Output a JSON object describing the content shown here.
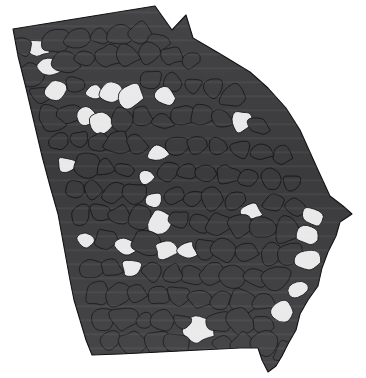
{
  "figure": {
    "type": "choropleth-map",
    "region_name": "Georgia",
    "subdivision_type": "county",
    "subdivision_count": 159,
    "background_color": "#ffffff",
    "border_color": "#15151a",
    "title": "",
    "subtitle": "",
    "legend_visible": false,
    "labels_visible": false,
    "axis_visible": false
  },
  "chart_data": {
    "type": "heatmap",
    "title": "",
    "xlabel": "",
    "ylabel": "",
    "legend_position": "none",
    "grid": false,
    "classes": [
      {
        "key": "dark",
        "color": "#3b3b3d",
        "count": 134
      },
      {
        "key": "light",
        "color": "#e9e9e9",
        "count": 25
      }
    ],
    "categories": [
      "dark",
      "light"
    ],
    "values": [
      134,
      25
    ],
    "regions": [
      {
        "name": "county-001",
        "class": "light",
        "cx": 36,
        "cy": 48
      },
      {
        "name": "county-002",
        "class": "dark",
        "cx": 22,
        "cy": 46
      },
      {
        "name": "county-003",
        "class": "dark",
        "cx": 56,
        "cy": 40
      },
      {
        "name": "county-004",
        "class": "dark",
        "cx": 78,
        "cy": 38
      },
      {
        "name": "county-005",
        "class": "dark",
        "cx": 99,
        "cy": 36
      },
      {
        "name": "county-006",
        "class": "dark",
        "cx": 120,
        "cy": 34
      },
      {
        "name": "county-007",
        "class": "dark",
        "cx": 141,
        "cy": 33
      },
      {
        "name": "county-008",
        "class": "dark",
        "cx": 160,
        "cy": 42
      },
      {
        "name": "county-009",
        "class": "dark",
        "cx": 30,
        "cy": 74
      },
      {
        "name": "county-010",
        "class": "light",
        "cx": 47,
        "cy": 66
      },
      {
        "name": "county-011",
        "class": "dark",
        "cx": 66,
        "cy": 62
      },
      {
        "name": "county-012",
        "class": "dark",
        "cx": 86,
        "cy": 58
      },
      {
        "name": "county-013",
        "class": "dark",
        "cx": 106,
        "cy": 56
      },
      {
        "name": "county-014",
        "class": "dark",
        "cx": 127,
        "cy": 54
      },
      {
        "name": "county-015",
        "class": "dark",
        "cx": 148,
        "cy": 52
      },
      {
        "name": "county-016",
        "class": "dark",
        "cx": 170,
        "cy": 56
      },
      {
        "name": "county-017",
        "class": "dark",
        "cx": 190,
        "cy": 60
      },
      {
        "name": "county-018",
        "class": "dark",
        "cx": 40,
        "cy": 94
      },
      {
        "name": "county-019",
        "class": "light",
        "cx": 56,
        "cy": 88
      },
      {
        "name": "county-020",
        "class": "dark",
        "cx": 74,
        "cy": 84
      },
      {
        "name": "county-021",
        "class": "light",
        "cx": 94,
        "cy": 92
      },
      {
        "name": "county-022",
        "class": "light",
        "cx": 112,
        "cy": 92
      },
      {
        "name": "county-023",
        "class": "light",
        "cx": 130,
        "cy": 96
      },
      {
        "name": "county-024",
        "class": "dark",
        "cx": 150,
        "cy": 80
      },
      {
        "name": "county-025",
        "class": "dark",
        "cx": 172,
        "cy": 82
      },
      {
        "name": "county-026",
        "class": "light",
        "cx": 164,
        "cy": 96
      },
      {
        "name": "county-027",
        "class": "dark",
        "cx": 193,
        "cy": 86
      },
      {
        "name": "county-028",
        "class": "dark",
        "cx": 212,
        "cy": 88
      },
      {
        "name": "county-029",
        "class": "dark",
        "cx": 232,
        "cy": 96
      },
      {
        "name": "county-030",
        "class": "dark",
        "cx": 50,
        "cy": 118
      },
      {
        "name": "county-031",
        "class": "dark",
        "cx": 68,
        "cy": 114
      },
      {
        "name": "county-032",
        "class": "light",
        "cx": 86,
        "cy": 116
      },
      {
        "name": "county-033",
        "class": "light",
        "cx": 102,
        "cy": 122
      },
      {
        "name": "county-034",
        "class": "dark",
        "cx": 122,
        "cy": 120
      },
      {
        "name": "county-035",
        "class": "dark",
        "cx": 142,
        "cy": 118
      },
      {
        "name": "county-036",
        "class": "dark",
        "cx": 162,
        "cy": 120
      },
      {
        "name": "county-037",
        "class": "dark",
        "cx": 182,
        "cy": 116
      },
      {
        "name": "county-038",
        "class": "dark",
        "cx": 202,
        "cy": 116
      },
      {
        "name": "county-039",
        "class": "dark",
        "cx": 222,
        "cy": 120
      },
      {
        "name": "county-040",
        "class": "light",
        "cx": 240,
        "cy": 122
      },
      {
        "name": "county-041",
        "class": "dark",
        "cx": 258,
        "cy": 126
      },
      {
        "name": "county-042",
        "class": "dark",
        "cx": 58,
        "cy": 142
      },
      {
        "name": "county-043",
        "class": "dark",
        "cx": 78,
        "cy": 140
      },
      {
        "name": "county-044",
        "class": "dark",
        "cx": 98,
        "cy": 142
      },
      {
        "name": "county-045",
        "class": "dark",
        "cx": 118,
        "cy": 144
      },
      {
        "name": "county-046",
        "class": "dark",
        "cx": 138,
        "cy": 146
      },
      {
        "name": "county-047",
        "class": "light",
        "cx": 158,
        "cy": 152
      },
      {
        "name": "county-048",
        "class": "dark",
        "cx": 178,
        "cy": 146
      },
      {
        "name": "county-049",
        "class": "dark",
        "cx": 198,
        "cy": 146
      },
      {
        "name": "county-050",
        "class": "dark",
        "cx": 218,
        "cy": 148
      },
      {
        "name": "county-051",
        "class": "dark",
        "cx": 240,
        "cy": 150
      },
      {
        "name": "county-052",
        "class": "dark",
        "cx": 262,
        "cy": 152
      },
      {
        "name": "county-053",
        "class": "dark",
        "cx": 282,
        "cy": 156
      },
      {
        "name": "county-054",
        "class": "light",
        "cx": 66,
        "cy": 166
      },
      {
        "name": "county-055",
        "class": "dark",
        "cx": 86,
        "cy": 166
      },
      {
        "name": "county-056",
        "class": "dark",
        "cx": 106,
        "cy": 168
      },
      {
        "name": "county-057",
        "class": "dark",
        "cx": 126,
        "cy": 170
      },
      {
        "name": "county-058",
        "class": "light",
        "cx": 146,
        "cy": 176
      },
      {
        "name": "county-059",
        "class": "dark",
        "cx": 168,
        "cy": 172
      },
      {
        "name": "county-060",
        "class": "dark",
        "cx": 188,
        "cy": 172
      },
      {
        "name": "county-061",
        "class": "dark",
        "cx": 208,
        "cy": 174
      },
      {
        "name": "county-062",
        "class": "dark",
        "cx": 228,
        "cy": 176
      },
      {
        "name": "county-063",
        "class": "dark",
        "cx": 250,
        "cy": 178
      },
      {
        "name": "county-064",
        "class": "dark",
        "cx": 272,
        "cy": 180
      },
      {
        "name": "county-065",
        "class": "dark",
        "cx": 292,
        "cy": 184
      },
      {
        "name": "county-066",
        "class": "dark",
        "cx": 74,
        "cy": 190
      },
      {
        "name": "county-067",
        "class": "dark",
        "cx": 94,
        "cy": 190
      },
      {
        "name": "county-068",
        "class": "dark",
        "cx": 114,
        "cy": 192
      },
      {
        "name": "county-069",
        "class": "light",
        "cx": 152,
        "cy": 200
      },
      {
        "name": "county-070",
        "class": "dark",
        "cx": 134,
        "cy": 194
      },
      {
        "name": "county-071",
        "class": "dark",
        "cx": 174,
        "cy": 196
      },
      {
        "name": "county-072",
        "class": "dark",
        "cx": 194,
        "cy": 198
      },
      {
        "name": "county-073",
        "class": "dark",
        "cx": 214,
        "cy": 200
      },
      {
        "name": "county-074",
        "class": "dark",
        "cx": 236,
        "cy": 200
      },
      {
        "name": "county-075",
        "class": "light",
        "cx": 252,
        "cy": 212
      },
      {
        "name": "county-076",
        "class": "dark",
        "cx": 274,
        "cy": 204
      },
      {
        "name": "county-077",
        "class": "dark",
        "cx": 296,
        "cy": 208
      },
      {
        "name": "county-078",
        "class": "light",
        "cx": 314,
        "cy": 216
      },
      {
        "name": "county-079",
        "class": "dark",
        "cx": 80,
        "cy": 214
      },
      {
        "name": "county-080",
        "class": "dark",
        "cx": 100,
        "cy": 214
      },
      {
        "name": "county-081",
        "class": "dark",
        "cx": 120,
        "cy": 216
      },
      {
        "name": "county-082",
        "class": "dark",
        "cx": 140,
        "cy": 218
      },
      {
        "name": "county-083",
        "class": "light",
        "cx": 160,
        "cy": 222
      },
      {
        "name": "county-084",
        "class": "dark",
        "cx": 180,
        "cy": 220
      },
      {
        "name": "county-085",
        "class": "dark",
        "cx": 200,
        "cy": 222
      },
      {
        "name": "county-086",
        "class": "dark",
        "cx": 220,
        "cy": 224
      },
      {
        "name": "county-087",
        "class": "dark",
        "cx": 242,
        "cy": 226
      },
      {
        "name": "county-088",
        "class": "dark",
        "cx": 264,
        "cy": 228
      },
      {
        "name": "county-089",
        "class": "dark",
        "cx": 286,
        "cy": 230
      },
      {
        "name": "county-090",
        "class": "light",
        "cx": 306,
        "cy": 236
      },
      {
        "name": "county-091",
        "class": "light",
        "cx": 86,
        "cy": 242
      },
      {
        "name": "county-092",
        "class": "dark",
        "cx": 106,
        "cy": 240
      },
      {
        "name": "county-093",
        "class": "light",
        "cx": 126,
        "cy": 246
      },
      {
        "name": "county-094",
        "class": "dark",
        "cx": 146,
        "cy": 244
      },
      {
        "name": "county-095",
        "class": "light",
        "cx": 166,
        "cy": 250
      },
      {
        "name": "county-096",
        "class": "light",
        "cx": 186,
        "cy": 250
      },
      {
        "name": "county-097",
        "class": "dark",
        "cx": 206,
        "cy": 248
      },
      {
        "name": "county-098",
        "class": "dark",
        "cx": 226,
        "cy": 250
      },
      {
        "name": "county-099",
        "class": "dark",
        "cx": 248,
        "cy": 252
      },
      {
        "name": "county-100",
        "class": "dark",
        "cx": 270,
        "cy": 254
      },
      {
        "name": "county-101",
        "class": "dark",
        "cx": 292,
        "cy": 256
      },
      {
        "name": "county-102",
        "class": "light",
        "cx": 310,
        "cy": 262
      },
      {
        "name": "county-103",
        "class": "light",
        "cx": 132,
        "cy": 268
      },
      {
        "name": "county-104",
        "class": "dark",
        "cx": 92,
        "cy": 268
      },
      {
        "name": "county-105",
        "class": "dark",
        "cx": 112,
        "cy": 268
      },
      {
        "name": "county-106",
        "class": "dark",
        "cx": 152,
        "cy": 272
      },
      {
        "name": "county-107",
        "class": "dark",
        "cx": 172,
        "cy": 274
      },
      {
        "name": "county-108",
        "class": "dark",
        "cx": 192,
        "cy": 274
      },
      {
        "name": "county-109",
        "class": "dark",
        "cx": 212,
        "cy": 274
      },
      {
        "name": "county-110",
        "class": "dark",
        "cx": 234,
        "cy": 276
      },
      {
        "name": "county-111",
        "class": "dark",
        "cx": 256,
        "cy": 278
      },
      {
        "name": "county-112",
        "class": "dark",
        "cx": 278,
        "cy": 280
      },
      {
        "name": "county-113",
        "class": "light",
        "cx": 300,
        "cy": 290
      },
      {
        "name": "county-114",
        "class": "dark",
        "cx": 98,
        "cy": 294
      },
      {
        "name": "county-115",
        "class": "dark",
        "cx": 118,
        "cy": 294
      },
      {
        "name": "county-116",
        "class": "dark",
        "cx": 138,
        "cy": 294
      },
      {
        "name": "county-117",
        "class": "dark",
        "cx": 158,
        "cy": 296
      },
      {
        "name": "county-118",
        "class": "dark",
        "cx": 178,
        "cy": 296
      },
      {
        "name": "county-119",
        "class": "dark",
        "cx": 198,
        "cy": 298
      },
      {
        "name": "county-120",
        "class": "dark",
        "cx": 220,
        "cy": 300
      },
      {
        "name": "county-121",
        "class": "dark",
        "cx": 242,
        "cy": 300
      },
      {
        "name": "county-122",
        "class": "dark",
        "cx": 264,
        "cy": 302
      },
      {
        "name": "county-123",
        "class": "light",
        "cx": 284,
        "cy": 312
      },
      {
        "name": "county-124",
        "class": "dark",
        "cx": 104,
        "cy": 318
      },
      {
        "name": "county-125",
        "class": "dark",
        "cx": 124,
        "cy": 318
      },
      {
        "name": "county-126",
        "class": "dark",
        "cx": 144,
        "cy": 320
      },
      {
        "name": "county-127",
        "class": "dark",
        "cx": 164,
        "cy": 320
      },
      {
        "name": "county-128",
        "class": "light",
        "cx": 198,
        "cy": 330
      },
      {
        "name": "county-129",
        "class": "dark",
        "cx": 182,
        "cy": 322
      },
      {
        "name": "county-130",
        "class": "dark",
        "cx": 218,
        "cy": 322
      },
      {
        "name": "county-131",
        "class": "dark",
        "cx": 240,
        "cy": 322
      },
      {
        "name": "county-132",
        "class": "dark",
        "cx": 262,
        "cy": 324
      },
      {
        "name": "county-133",
        "class": "dark",
        "cx": 112,
        "cy": 340
      },
      {
        "name": "county-134",
        "class": "dark",
        "cx": 134,
        "cy": 342
      },
      {
        "name": "county-135",
        "class": "dark",
        "cx": 156,
        "cy": 342
      },
      {
        "name": "county-136",
        "class": "dark",
        "cx": 178,
        "cy": 344
      },
      {
        "name": "county-137",
        "class": "dark",
        "cx": 222,
        "cy": 344
      },
      {
        "name": "county-138",
        "class": "dark",
        "cx": 244,
        "cy": 344
      },
      {
        "name": "county-139",
        "class": "dark",
        "cx": 266,
        "cy": 344
      },
      {
        "name": "county-140",
        "class": "dark",
        "cx": 286,
        "cy": 352
      }
    ]
  }
}
